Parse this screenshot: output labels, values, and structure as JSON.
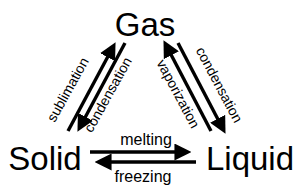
{
  "diagram": {
    "background_color": "#ffffff",
    "stroke_color": "#000000",
    "states": [
      {
        "id": "gas",
        "label": "Gas",
        "x": 145,
        "y": 25,
        "font_size": 30
      },
      {
        "id": "solid",
        "label": "Solid",
        "x": 45,
        "y": 159,
        "font_size": 30
      },
      {
        "id": "liquid",
        "label": "Liquid",
        "x": 250,
        "y": 159,
        "font_size": 30
      }
    ],
    "processes": [
      {
        "id": "sublimation",
        "label": "sublimation",
        "from": "solid",
        "to": "gas",
        "side": "left-outer",
        "font_size": 13,
        "rotation": -56,
        "x": 72,
        "y": 92
      },
      {
        "id": "deposition",
        "label": "condensation",
        "from": "gas",
        "to": "solid",
        "side": "left-inner",
        "font_size": 13,
        "rotation": -56,
        "x": 113,
        "y": 96
      },
      {
        "id": "vaporization",
        "label": "vaporization",
        "from": "liquid",
        "to": "gas",
        "side": "right-inner",
        "font_size": 13,
        "rotation": 58,
        "x": 172,
        "y": 95
      },
      {
        "id": "condensation",
        "label": "condensation",
        "from": "gas",
        "to": "liquid",
        "side": "right-outer",
        "font_size": 13,
        "rotation": 58,
        "x": 215,
        "y": 85
      },
      {
        "id": "melting",
        "label": "melting",
        "from": "solid",
        "to": "liquid",
        "side": "bottom-above",
        "font_size": 15,
        "rotation": 0,
        "x": 146,
        "y": 143
      },
      {
        "id": "freezing",
        "label": "freezing",
        "from": "liquid",
        "to": "solid",
        "side": "bottom-below",
        "font_size": 15,
        "rotation": 0,
        "x": 143,
        "y": 180
      }
    ]
  }
}
